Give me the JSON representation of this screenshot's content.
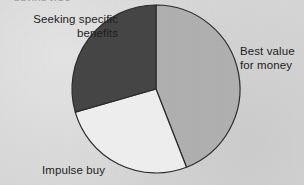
{
  "figure": {
    "background_color": "#d6d6d6",
    "text_color": "#1d1d1d",
    "clipped_caption": "buying type"
  },
  "labels": {
    "seeking": "Seeking specific\nbenefits",
    "best_value": "Best value\nfor money",
    "impulse": "Impulse buy"
  },
  "chart_data": {
    "type": "pie",
    "title": "",
    "subtitle": "",
    "xlabel": "",
    "ylabel": "",
    "legend_position": "none",
    "grid": false,
    "labels_placement": "outside-callout",
    "start_angle_deg": 0,
    "direction": "clockwise",
    "center": {
      "x": 156,
      "y": 89
    },
    "radius": 84,
    "stroke_color": "#2a2a2a",
    "stroke_width": 1.2,
    "categories": [
      "Best value for money",
      "Impulse buy",
      "Seeking specific benefits"
    ],
    "values": [
      44,
      26,
      30
    ],
    "value_unit": "%",
    "slices": [
      {
        "name": "Best value for money",
        "value": 44,
        "percent": 44,
        "start_angle_deg": 0,
        "end_angle_deg": 158.7,
        "color": "#b0b0b0"
      },
      {
        "name": "Impulse buy",
        "value": 26,
        "percent": 26,
        "start_angle_deg": 158.7,
        "end_angle_deg": 254.0,
        "color": "#efefef"
      },
      {
        "name": "Seeking specific benefits",
        "value": 30,
        "percent": 30,
        "start_angle_deg": 254.0,
        "end_angle_deg": 360.0,
        "color": "#454545"
      }
    ]
  }
}
